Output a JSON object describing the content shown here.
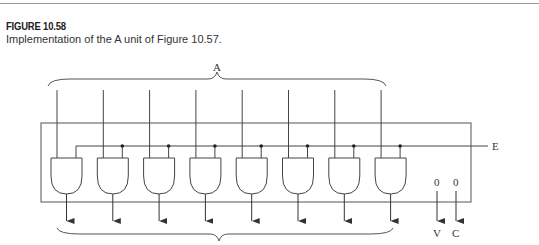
{
  "figure": {
    "number": "FIGURE 10.58",
    "caption": "Implementation of the A unit of Figure 10.57."
  },
  "diagram": {
    "input_bus_label": "A",
    "enable_label": "E",
    "gate_type": "AND",
    "gate_count": 8,
    "constant_outputs": [
      {
        "value": "0",
        "label": "V"
      },
      {
        "value": "0",
        "label": "C"
      }
    ],
    "colors": {
      "line": "#444444",
      "background": "#ffffff"
    }
  }
}
